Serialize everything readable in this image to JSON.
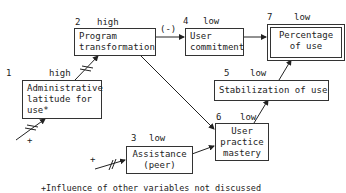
{
  "nodes": [
    {
      "id": 1,
      "number": "1",
      "level": "high",
      "lines": [
        "Administrative",
        "latitude for",
        "use*"
      ]
    },
    {
      "id": 2,
      "number": "2",
      "level": "high",
      "lines": [
        "Program",
        "transformation"
      ]
    },
    {
      "id": 3,
      "number": "3",
      "level": "low",
      "lines": [
        "Assistance",
        "(peer)"
      ]
    },
    {
      "id": 4,
      "number": "4",
      "level": "low",
      "lines": [
        "User",
        "commitment"
      ]
    },
    {
      "id": 5,
      "number": "5",
      "level": "low",
      "lines": [
        "Stabilization of use"
      ]
    },
    {
      "id": 6,
      "number": "6",
      "level": "low",
      "lines": [
        "User",
        "practice",
        "mastery"
      ]
    },
    {
      "id": 7,
      "number": "7",
      "level": "low",
      "lines": [
        "Percentage",
        "of use"
      ]
    }
  ],
  "edges": [
    {
      "from": 1,
      "to": 2,
      "label": ""
    },
    {
      "from": 2,
      "to": 4,
      "label": "(-)"
    },
    {
      "from": 4,
      "to": 7,
      "label": ""
    },
    {
      "from": 2,
      "to": 6,
      "label": ""
    },
    {
      "from": 3,
      "to": 6,
      "label": ""
    },
    {
      "from": 6,
      "to": 5,
      "label": ""
    },
    {
      "from": 5,
      "to": 7,
      "label": ""
    }
  ],
  "external_influence_marker": "+",
  "edge_label_negative": "(-)",
  "footnote": "+Influence of other variables not discussed"
}
